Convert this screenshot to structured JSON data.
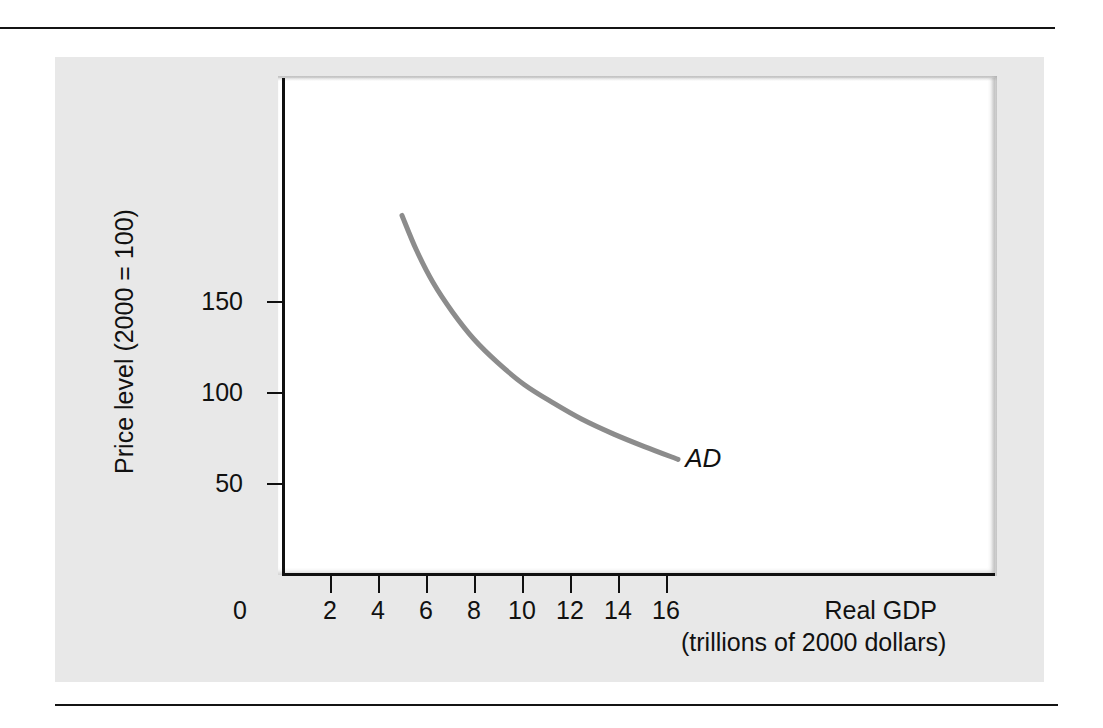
{
  "figure": {
    "panel_color": "#e8e8e8",
    "plot_background": "#ffffff",
    "rule_color": "#141414"
  },
  "chart_data": {
    "type": "line",
    "title": "",
    "subtitle": "",
    "xlabel": "Real GDP",
    "xlabel_sub": "(trillions of 2000 dollars)",
    "ylabel": "Price level (2000 = 100)",
    "xlim": [
      0,
      18
    ],
    "ylim": [
      0,
      220
    ],
    "grid": false,
    "legend": "none",
    "xticks": [
      0,
      2,
      4,
      6,
      8,
      10,
      12,
      14,
      16
    ],
    "xticklabels": [
      "0",
      "2",
      "4",
      "6",
      "8",
      "10",
      "12",
      "14",
      "16"
    ],
    "yticks": [
      50,
      100,
      150
    ],
    "yticklabels": [
      "50",
      "100",
      "150"
    ],
    "series": [
      {
        "name": "AD",
        "label": "AD",
        "label_style": "italic",
        "color": "#8c8c8c",
        "linewidth": 5,
        "x": [
          5.0,
          5.6,
          6.3,
          7.1,
          8.0,
          9.0,
          10.1,
          11.3,
          12.5,
          13.8,
          15.1,
          16.5
        ],
        "y": [
          197,
          178,
          160,
          144,
          129,
          116,
          104,
          94,
          85,
          77,
          70,
          63
        ]
      }
    ],
    "annotations": [
      {
        "text": "AD",
        "x": 17.3,
        "y": 62,
        "style": "italic"
      }
    ]
  }
}
